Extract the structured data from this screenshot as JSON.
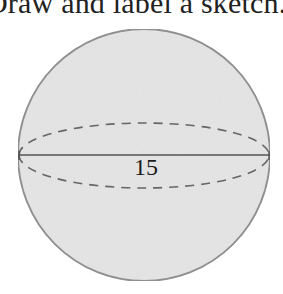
{
  "instruction": {
    "text": "Draw and label a sketch."
  },
  "figure": {
    "shape": "sphere",
    "diameter_label": "15",
    "colors": {
      "fill": "#e6e6e6",
      "outline": "#8a8a8a",
      "line": "#555555",
      "dashed": "#666666",
      "text": "#1a1a1a"
    }
  }
}
